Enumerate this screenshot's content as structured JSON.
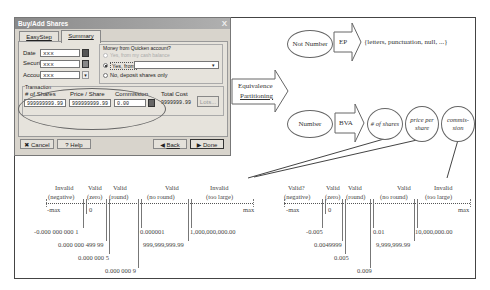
{
  "dialog": {
    "title": "Buy/Add Shares",
    "close": "X",
    "tabs": [
      {
        "label": "EasyStep",
        "active": false
      },
      {
        "label": "Summary",
        "active": true
      }
    ],
    "fields": {
      "date_label": "Date",
      "date_value": "xxx",
      "security_label": "Security",
      "security_value": "xxx",
      "account_label": "Account",
      "account_value": "xxx"
    },
    "money_group": {
      "title": "Money from Quicken account?",
      "options": [
        {
          "label": "Yes, from my cash balance",
          "selected": false,
          "disabled": true
        },
        {
          "label": "Yes, from",
          "selected": true,
          "disabled": false
        },
        {
          "label": "No, deposit shares only",
          "selected": false,
          "disabled": false
        }
      ],
      "from_account_value": ""
    },
    "transaction": {
      "title": "Transaction",
      "shares_label": "# of Shares",
      "shares_value": "999999999.99",
      "price_label": "Price / Share",
      "price_value": "999999999.99",
      "commission_label": "Commission",
      "commission_value": "0.00",
      "total_label": "Total Cost",
      "total_value": "9999999.99",
      "lots_button": "Lots..."
    },
    "buttons": {
      "cancel": "Cancel",
      "help": "Help",
      "back": "Back",
      "done": "Done"
    }
  },
  "diagram": {
    "ep_label_line1": "Equivalence",
    "ep_label_line2": "Partitioning",
    "not_number": "Not Number",
    "ep": "EP",
    "not_number_set": "{letters, punctuation, null, ...}",
    "number": "Number",
    "bva": "BVA",
    "shares": "# of shares",
    "price_line1": "price per",
    "price_line2": "share",
    "commission_line1": "commis-",
    "commission_line2": "sion"
  },
  "left_line": {
    "classes": [
      {
        "status": "Invalid",
        "range": "(negative)"
      },
      {
        "status": "Valid",
        "range": "(zero)"
      },
      {
        "status": "Valid",
        "range": "(round)"
      },
      {
        "status": "Valid",
        "range": "(no round)"
      },
      {
        "status": "Invalid",
        "range": "(too large)"
      }
    ],
    "min_label": "-max",
    "zero_label": "0",
    "max_label": "max",
    "values": [
      "-0.000 000 000 1",
      "0.000 000 499 99",
      "0.000 000 5",
      "0.000 000 9",
      "0.000001",
      "999,999,999.99",
      "1,000,000,000.00"
    ]
  },
  "right_line": {
    "classes": [
      {
        "status": "Valid?",
        "range": "(negative)"
      },
      {
        "status": "Valid",
        "range": "(zero)"
      },
      {
        "status": "Valid",
        "range": "(round)"
      },
      {
        "status": "Valid",
        "range": "(no round)"
      },
      {
        "status": "Invalid",
        "range": "(too large)"
      }
    ],
    "min_label": "-max",
    "zero_label": "0",
    "max_label": "max",
    "values": [
      "-0.005",
      "0.0049999",
      "0.005",
      "0.009",
      "0.01",
      "9,999,999.99",
      "10,000,000.00"
    ]
  }
}
